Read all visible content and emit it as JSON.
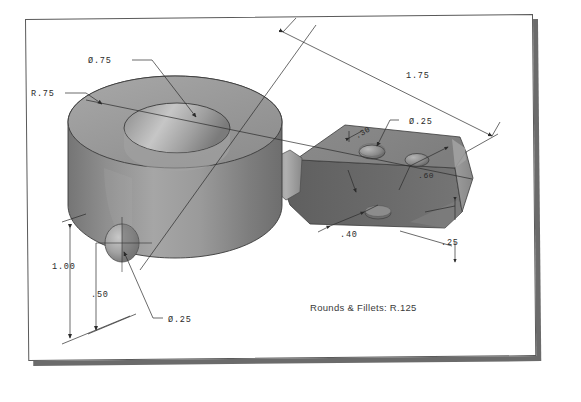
{
  "document": {
    "type": "isometric-technical-drawing",
    "subject": "Machined bracket: cylindrical boss with through bore and rectangular arm"
  },
  "sheet": {
    "background_color": "#ffffff",
    "border_color": "#5a5a5a",
    "shadow_color": "#6b6b6b"
  },
  "part": {
    "body_fill": "#8e8e8e",
    "top_fill": "#9a9a9a",
    "dark_fill": "#6a6a6a",
    "light_fill": "#b4b4b4",
    "edge_color": "#3a3a3a"
  },
  "dimensions": [
    {
      "id": "bore-dia",
      "label": "Ø.75",
      "x": 88,
      "y": 57,
      "meaning": "diameter of central through bore"
    },
    {
      "id": "boss-radius",
      "label": "R.75",
      "x": 31,
      "y": 90,
      "meaning": "radius of cylindrical boss"
    },
    {
      "id": "overall-length",
      "label": "1.75",
      "x": 406,
      "y": 72,
      "meaning": "overall length of arm"
    },
    {
      "id": "arm-hole-dia",
      "label": "Ø.25",
      "x": 409,
      "y": 118,
      "meaning": "diameter of arm holes"
    },
    {
      "id": "hole-offset",
      "label": ".30",
      "x": 356,
      "y": 133,
      "meaning": "hole offset from arm edge"
    },
    {
      "id": "arm-width",
      "label": ".60",
      "x": 418,
      "y": 172,
      "meaning": "arm width"
    },
    {
      "id": "hole-spacing",
      "label": ".40",
      "x": 340,
      "y": 231,
      "meaning": "spacing between arm holes"
    },
    {
      "id": "arm-thickness",
      "label": ".25",
      "x": 441,
      "y": 239,
      "meaning": "arm plate thickness"
    },
    {
      "id": "boss-height",
      "label": "1.00",
      "x": 52,
      "y": 263,
      "meaning": "overall height of boss"
    },
    {
      "id": "side-hole-height",
      "label": ".50",
      "x": 91,
      "y": 291,
      "meaning": "height of side hole centerline"
    },
    {
      "id": "side-hole-dia",
      "label": "Ø.25",
      "x": 168,
      "y": 316,
      "meaning": "diameter of side hole"
    }
  ],
  "notes": [
    {
      "id": "rounds-fillets",
      "text": "Rounds & Fillets: R.125",
      "x": 310,
      "y": 302
    }
  ]
}
